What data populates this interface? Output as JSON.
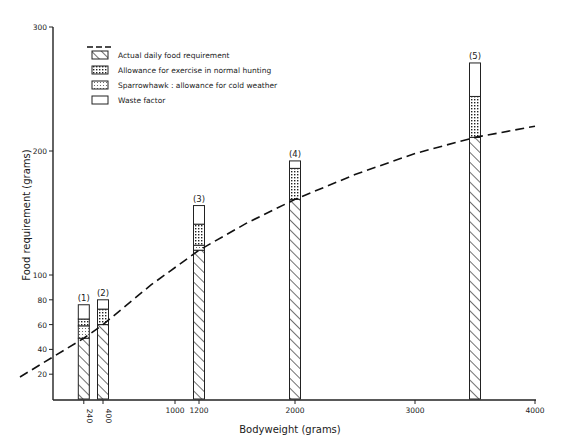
{
  "chart_data": {
    "type": "bar",
    "subtype": "stacked-bar-with-curve",
    "title": "",
    "xlabel": "Bodyweight (grams)",
    "ylabel": "Food requirement (grams)",
    "xlim": [
      0,
      4000
    ],
    "ylim": [
      0,
      300
    ],
    "grid": false,
    "legend_position": "top-left",
    "x_ticks": [
      {
        "value": 240,
        "label": "240",
        "rotated": true
      },
      {
        "value": 400,
        "label": "400",
        "rotated": true
      },
      {
        "value": 1000,
        "label": "1000",
        "rotated": false
      },
      {
        "value": 1200,
        "label": "1200",
        "rotated": false
      },
      {
        "value": 2000,
        "label": "2000",
        "rotated": false
      },
      {
        "value": 3000,
        "label": "3000",
        "rotated": false
      },
      {
        "value": 4000,
        "label": "4000",
        "rotated": false
      }
    ],
    "y_ticks": [
      {
        "value": 20,
        "label": "20"
      },
      {
        "value": 40,
        "label": "40"
      },
      {
        "value": 60,
        "label": "60"
      },
      {
        "value": 80,
        "label": "80"
      },
      {
        "value": 100,
        "label": "100"
      },
      {
        "value": 200,
        "label": "200"
      },
      {
        "value": 300,
        "label": "300"
      }
    ],
    "legend": [
      {
        "key": "curve",
        "pattern": "dashed-line",
        "label": ""
      },
      {
        "key": "actual",
        "pattern": "hatch",
        "label": "Actual daily food requirement"
      },
      {
        "key": "exercise",
        "pattern": "grid",
        "label": "Allowance for exercise in normal hunting"
      },
      {
        "key": "cold",
        "pattern": "dots",
        "label": "Sparrowhawk : allowance for cold weather"
      },
      {
        "key": "waste",
        "pattern": "empty",
        "label": "Waste factor"
      }
    ],
    "bars": [
      {
        "label": "(1)",
        "bodyweight": 240,
        "actual": 49,
        "cold": 10,
        "exercise": 5.5,
        "waste": 11.5,
        "total": 76
      },
      {
        "label": "(2)",
        "bodyweight": 400,
        "actual": 60,
        "cold": 0,
        "exercise": 12.5,
        "waste": 7.5,
        "total": 80
      },
      {
        "label": "(3)",
        "bodyweight": 1200,
        "actual": 120,
        "cold": 4,
        "exercise": 17,
        "waste": 15,
        "total": 156
      },
      {
        "label": "(4)",
        "bodyweight": 2000,
        "actual": 161,
        "cold": 0,
        "exercise": 25,
        "waste": 6,
        "total": 192
      },
      {
        "label": "(5)",
        "bodyweight": 3500,
        "actual": 211,
        "cold": 0,
        "exercise": 33,
        "waste": 27,
        "total": 271
      }
    ],
    "curve": {
      "name": "Actual daily food requirement (curve)",
      "style": "dashed",
      "x": [
        0,
        240,
        400,
        800,
        1200,
        1600,
        2000,
        2500,
        3000,
        3500,
        4000
      ],
      "y": [
        21,
        49,
        60,
        92,
        120,
        142,
        161,
        181,
        198,
        211,
        220
      ]
    }
  }
}
